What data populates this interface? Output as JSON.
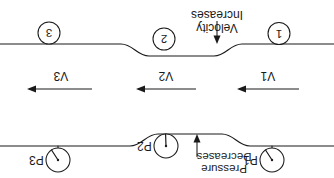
{
  "diagram": {
    "orientation_note": "rotated-180",
    "stroke_color": "#1a1a1a",
    "background_color": "#ffffff",
    "sections": [
      {
        "id": "section-1",
        "label": "1"
      },
      {
        "id": "section-2",
        "label": "2"
      },
      {
        "id": "section-3",
        "label": "3"
      }
    ],
    "velocity_labels": [
      {
        "id": "velocity-1",
        "label": "V1"
      },
      {
        "id": "velocity-2",
        "label": "V2"
      },
      {
        "id": "velocity-3",
        "label": "V3"
      }
    ],
    "pressure_gauges": [
      {
        "id": "gauge-1",
        "label": "P1",
        "needle_deg": 55
      },
      {
        "id": "gauge-2",
        "label": "P2",
        "needle_deg": 2
      },
      {
        "id": "gauge-3",
        "label": "P3",
        "needle_deg": 55
      }
    ],
    "annotations": {
      "velocity": {
        "line1": "Velocity",
        "line2": "Increases"
      },
      "pressure": {
        "line1": "Pressure",
        "line2": "Decreases"
      }
    }
  }
}
